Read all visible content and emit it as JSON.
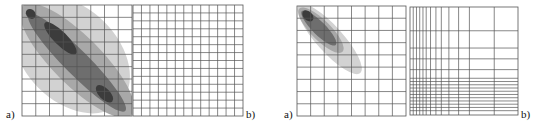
{
  "figures": [
    {
      "name": "figure-left",
      "panel_a_label": "a)",
      "panel_b_label": "b)",
      "panel_a": {
        "grid_cols": 8,
        "grid_rows": 9,
        "description": "contour density map along diagonal, broad band"
      },
      "panel_b": {
        "grid_cols": 16,
        "grid_rows": 16,
        "spacing": "uniform"
      }
    },
    {
      "name": "figure-right",
      "panel_a_label": "a)",
      "panel_b_label": "b)",
      "panel_a": {
        "grid_cols": 8,
        "grid_rows": 9,
        "description": "contour density map concentrated top-left diagonal"
      },
      "panel_b": {
        "spacing": "non-uniform, dense toward left and bottom"
      }
    }
  ],
  "colors": {
    "grid": "#555555",
    "shade_light": "#d2d2d2",
    "shade_mid": "#a8a8a8",
    "shade_dark": "#6e6e6e",
    "shade_darkest": "#3c3c3c"
  }
}
